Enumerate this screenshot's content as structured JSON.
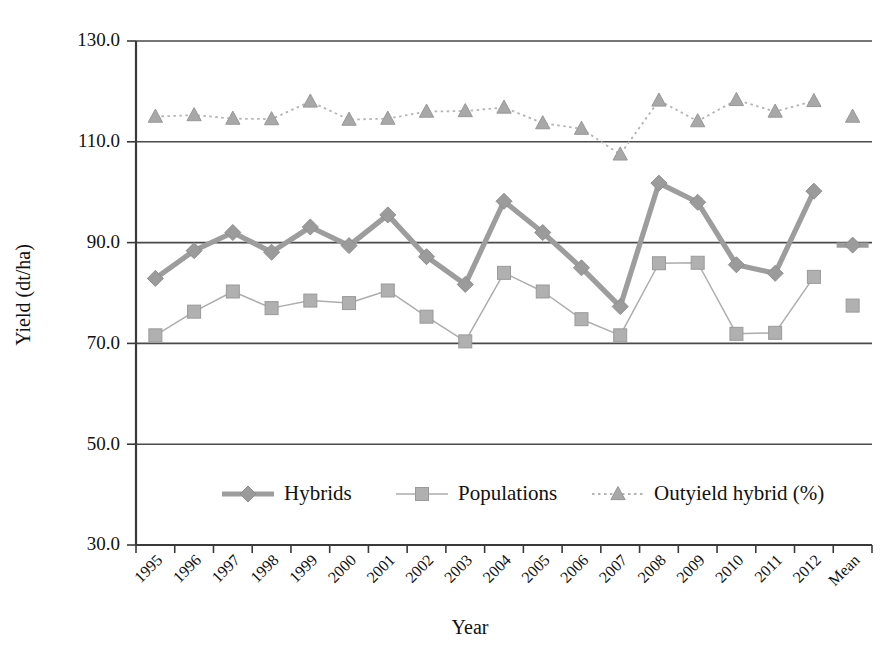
{
  "chart_data": {
    "type": "line",
    "title": "",
    "xlabel": "Year",
    "ylabel": "Yield (dt/ha)",
    "ylim": [
      30.0,
      130.0
    ],
    "yticks": [
      "30.0",
      "50.0",
      "70.0",
      "90.0",
      "110.0",
      "130.0"
    ],
    "ytick_values": [
      30.0,
      50.0,
      70.0,
      90.0,
      110.0,
      130.0
    ],
    "grid": "horizontal",
    "legend_position": "inside-bottom-center",
    "categories": [
      "1995",
      "1996",
      "1997",
      "1998",
      "1999",
      "2000",
      "2001",
      "2002",
      "2003",
      "2004",
      "2005",
      "2006",
      "2007",
      "2008",
      "2009",
      "2010",
      "2011",
      "2012",
      "Mean"
    ],
    "series": [
      {
        "name": "Hybrids",
        "marker": "diamond",
        "color": "#9b9b9b",
        "linestyle": "solid-thick",
        "values": [
          82.9,
          88.4,
          92.0,
          88.1,
          93.1,
          89.4,
          95.5,
          87.2,
          81.7,
          98.2,
          92.0,
          85.0,
          77.3,
          101.8,
          98.0,
          85.6,
          83.9,
          100.2,
          89.5
        ]
      },
      {
        "name": "Populations",
        "marker": "square",
        "color": "#b0b0b0",
        "linestyle": "solid-thin",
        "values": [
          71.6,
          76.3,
          80.3,
          77.0,
          78.5,
          78.0,
          80.5,
          75.3,
          70.4,
          84.0,
          80.3,
          74.8,
          71.6,
          85.9,
          86.0,
          71.9,
          72.1,
          83.2,
          77.5
        ]
      },
      {
        "name": "Outyield hybrid (%)",
        "marker": "triangle",
        "color": "#a8a8a8",
        "linestyle": "dotted",
        "values": [
          115.0,
          115.3,
          114.6,
          114.5,
          118.0,
          114.4,
          114.6,
          116.0,
          116.1,
          116.8,
          113.7,
          112.6,
          107.5,
          118.2,
          114.1,
          118.3,
          116.0,
          118.1,
          115.0
        ]
      }
    ]
  },
  "legend": {
    "items": [
      {
        "label": "Hybrids"
      },
      {
        "label": "Populations"
      },
      {
        "label": "Outyield hybrid (%)"
      }
    ]
  }
}
